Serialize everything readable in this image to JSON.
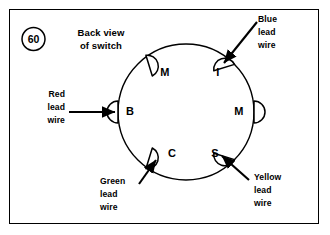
{
  "figure": {
    "badge_number": "60",
    "title_line1": "Back view",
    "title_line2": "of switch"
  },
  "diagram": {
    "shape": "circle",
    "center": {
      "x": 186,
      "y": 112
    },
    "radius": 68
  },
  "terminals": [
    {
      "id": "terminal-m-upper-left",
      "label": "M",
      "angle_deg": 125,
      "label_x": 165,
      "label_y": 73
    },
    {
      "id": "terminal-i",
      "label": "I",
      "angle_deg": 55,
      "label_x": 218,
      "label_y": 73
    },
    {
      "id": "terminal-m-right",
      "label": "M",
      "angle_deg": 0,
      "label_x": 239,
      "label_y": 112
    },
    {
      "id": "terminal-s",
      "label": "S",
      "angle_deg": -55,
      "label_x": 215,
      "label_y": 154
    },
    {
      "id": "terminal-c",
      "label": "C",
      "angle_deg": -125,
      "label_x": 172,
      "label_y": 154
    },
    {
      "id": "terminal-b",
      "label": "B",
      "angle_deg": 180,
      "label_x": 130,
      "label_y": 112
    }
  ],
  "lead_wires": [
    {
      "id": "red-lead-wire",
      "color_name": "Red",
      "line1": "Red",
      "line2": "lead",
      "line3": "wire",
      "target_terminal": "B",
      "label_x": 44,
      "label_y": 89,
      "label_align": "right"
    },
    {
      "id": "blue-lead-wire",
      "color_name": "Blue",
      "line1": "Blue",
      "line2": "lead",
      "line3": "wire",
      "target_terminal": "I",
      "label_x": 258,
      "label_y": 14,
      "label_align": "left"
    },
    {
      "id": "yellow-lead-wire",
      "color_name": "Yellow",
      "line1": "Yellow",
      "line2": "lead",
      "line3": "wire",
      "target_terminal": "S",
      "label_x": 254,
      "label_y": 172,
      "label_align": "left"
    },
    {
      "id": "green-lead-wire",
      "color_name": "Green",
      "line1": "Green",
      "line2": "lead",
      "line3": "wire",
      "target_terminal": "C",
      "label_x": 100,
      "label_y": 176,
      "label_align": "left"
    }
  ],
  "colors": {
    "ink": "#000000",
    "paper": "#ffffff"
  }
}
